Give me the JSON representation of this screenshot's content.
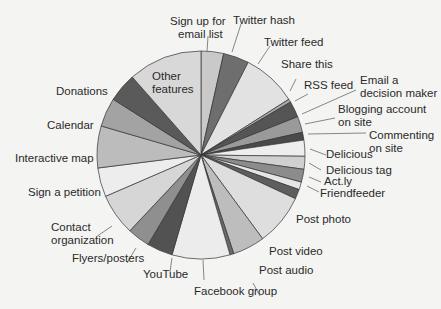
{
  "chart_data": {
    "type": "pie",
    "title": "",
    "start_angle_deg": 0,
    "direction": "clockwise",
    "slices": [
      {
        "label": "Sign up for email list",
        "value": 3.5,
        "color": "#c9c9c9"
      },
      {
        "label": "Twitter hash",
        "value": 4.0,
        "color": "#6e6e6e"
      },
      {
        "label": "Twitter feed",
        "value": 8.5,
        "color": "#e2e2e2"
      },
      {
        "label": "Share this",
        "value": 0.5,
        "color": "#a8a8a8"
      },
      {
        "label": "RSS feed",
        "value": 2.5,
        "color": "#555555"
      },
      {
        "label": "Email a decision maker",
        "value": 2.5,
        "color": "#9a9a9a"
      },
      {
        "label": "Blogging account on site",
        "value": 1.2,
        "color": "#4a4a4a"
      },
      {
        "label": "Commenting on site",
        "value": 2.5,
        "color": "#eeeeee"
      },
      {
        "label": "Delicious",
        "value": 2.0,
        "color": "#d0d0d0"
      },
      {
        "label": "Delicious tag",
        "value": 2.0,
        "color": "#8c8c8c"
      },
      {
        "label": "Act.ly",
        "value": 1.2,
        "color": "#e6e6e6"
      },
      {
        "label": "Friendfeeder",
        "value": 1.5,
        "color": "#5e5e5e"
      },
      {
        "label": "Post photo",
        "value": 8.0,
        "color": "#dedede"
      },
      {
        "label": "Post video",
        "value": 5.0,
        "color": "#bdbdbd"
      },
      {
        "label": "Post audio",
        "value": 0.6,
        "color": "#6a6a6a"
      },
      {
        "label": "Facebook group",
        "value": 9.0,
        "color": "#ececec"
      },
      {
        "label": "YouTube",
        "value": 4.0,
        "color": "#525252"
      },
      {
        "label": "Flyers/posters",
        "value": 3.5,
        "color": "#8f8f8f"
      },
      {
        "label": "Contact organization",
        "value": 6.5,
        "color": "#d6d6d6"
      },
      {
        "label": "Sign a petition",
        "value": 4.5,
        "color": "#ededed"
      },
      {
        "label": "Interactive map",
        "value": 6.5,
        "color": "#bcbcbc"
      },
      {
        "label": "Calendar",
        "value": 4.5,
        "color": "#a3a3a3"
      },
      {
        "label": "Donations",
        "value": 4.5,
        "color": "#5a5a5a"
      },
      {
        "label": "Other features",
        "value": 11.5,
        "color": "#d8d8d8"
      }
    ],
    "legend": "none (callout labels)",
    "grid": false
  },
  "labels": {
    "sign_up_1": "Sign up for",
    "sign_up_2": "email list",
    "twitter_hash": "Twitter hash",
    "twitter_feed": "Twitter feed",
    "share_this": "Share this",
    "rss_feed": "RSS feed",
    "email_1": "Email a",
    "email_2": "decision maker",
    "blogging_1": "Blogging account",
    "blogging_2": "on site",
    "commenting_1": "Commenting",
    "commenting_2": "on site",
    "delicious": "Delicious",
    "delicious_tag": "Delicious tag",
    "actly": "Act.ly",
    "friendfeeder": "Friendfeeder",
    "post_photo": "Post photo",
    "post_video": "Post video",
    "post_audio": "Post audio",
    "facebook_group": "Facebook group",
    "youtube": "YouTube",
    "flyers": "Flyers/posters",
    "contact_1": "Contact",
    "contact_2": "organization",
    "petition": "Sign a petition",
    "interactive_map": "Interactive map",
    "calendar": "Calendar",
    "donations": "Donations",
    "other_1": "Other",
    "other_2": "features"
  }
}
